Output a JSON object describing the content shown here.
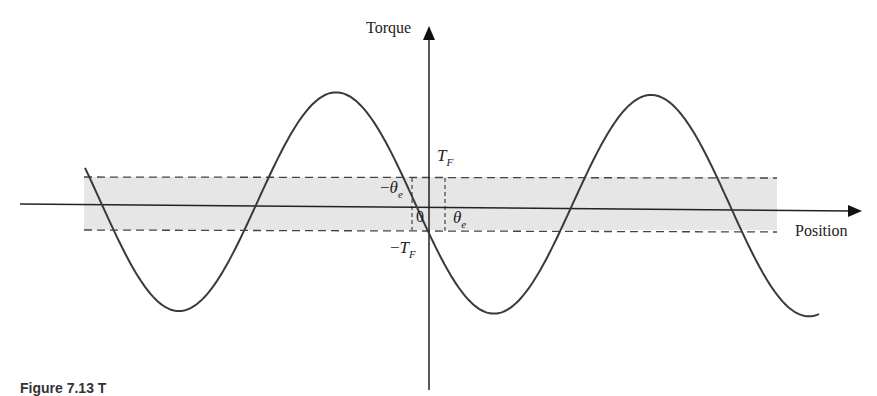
{
  "figure": {
    "y_axis_label": "Torque",
    "x_axis_label": "Position",
    "labels": {
      "tf_pos": {
        "main": "T",
        "sub": "F"
      },
      "tf_neg": {
        "sign": "−",
        "main": "T",
        "sub": "F"
      },
      "theta_neg": {
        "sign": "−",
        "main": "θ",
        "sub": "e"
      },
      "theta_pos": {
        "main": "θ",
        "sub": "e"
      },
      "origin": "0"
    },
    "caption_partial": "Figure 7.13   T"
  },
  "colors": {
    "curve": "#3a3a3a",
    "axis": "#222222",
    "band_fill": "#e6e6e6",
    "dash": "#444444"
  },
  "chart_data": {
    "type": "line",
    "title": "",
    "xlabel": "Position",
    "ylabel": "Torque",
    "series": [
      {
        "name": "Torque vs Position (sinusoidal)",
        "shape": "negative sine through origin",
        "period_px": 315,
        "amplitude_px": 110,
        "zero_crossing_origin": true
      }
    ],
    "band": {
      "upper": "T_F",
      "lower": "-T_F",
      "shaded": true,
      "dashed_bounds": true
    },
    "markers": {
      "x_left": "-θ_e",
      "x_right": "θ_e",
      "origin": "0"
    },
    "grid": false
  }
}
